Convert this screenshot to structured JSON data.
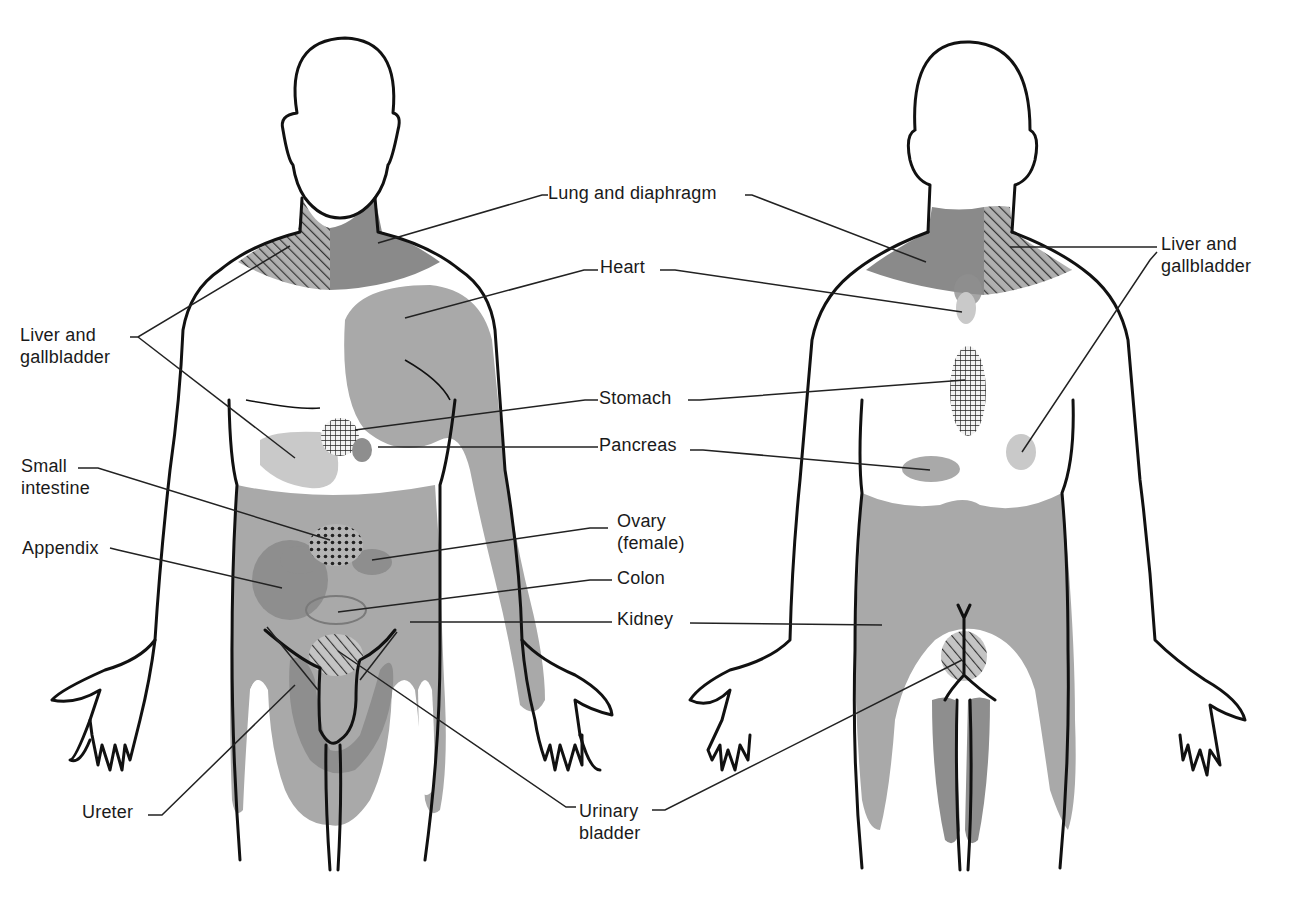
{
  "figure": {
    "views": [
      "anterior",
      "posterior"
    ],
    "colors": {
      "background": "#ffffff",
      "outline": "#111111",
      "shade_light": "#c9c9c9",
      "shade_mid": "#a9a9a9",
      "shade_dark": "#8e8e8e",
      "hatch": "#333333"
    }
  },
  "labels": {
    "lung_diaphragm": "Lung and diaphragm",
    "heart": "Heart",
    "liver_left": "Liver and\ngallbladder",
    "liver_right": "Liver and\ngallbladder",
    "stomach": "Stomach",
    "pancreas": "Pancreas",
    "small_intestine": "Small\nintestine",
    "appendix": "Appendix",
    "ovary": "Ovary\n(female)",
    "colon": "Colon",
    "kidney": "Kidney",
    "ureter": "Ureter",
    "urinary_bladder": "Urinary\nbladder"
  }
}
